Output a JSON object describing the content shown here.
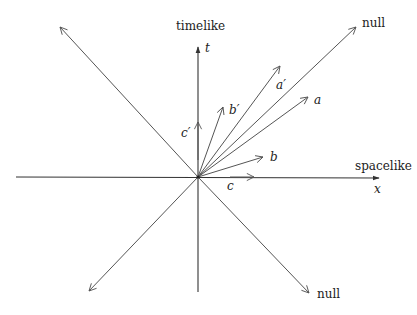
{
  "diagram": {
    "type": "spacetime-vectors",
    "origin": [
      198,
      177
    ],
    "axes": {
      "time": {
        "label": "timelike",
        "symbol": "t"
      },
      "space": {
        "label": "spacelike",
        "symbol": "x"
      }
    },
    "null_lines": {
      "upper_right_label": "null",
      "lower_right_label": "null"
    },
    "vectors": [
      {
        "id": "a",
        "label": "a"
      },
      {
        "id": "a-prime",
        "label": "a′"
      },
      {
        "id": "b",
        "label": "b"
      },
      {
        "id": "b-prime",
        "label": "b′"
      },
      {
        "id": "c",
        "label": "c"
      },
      {
        "id": "c-prime",
        "label": "c′"
      }
    ],
    "colors": {
      "line": "#555555",
      "axis": "#333333",
      "text": "#222222",
      "background": "#ffffff"
    }
  }
}
